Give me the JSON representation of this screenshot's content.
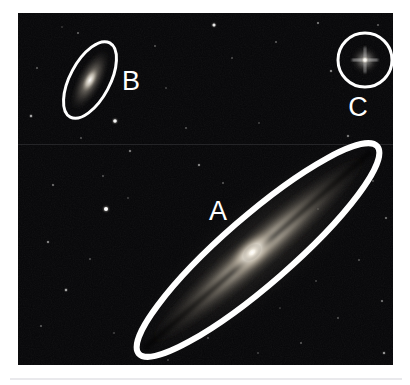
{
  "figure": {
    "kind": "astronomical-plate",
    "background_color": "#ffffff",
    "plate_color": "#050507",
    "annotation_color": "#ffffff",
    "plate_rect": {
      "x": 18,
      "y": 13,
      "width": 375,
      "height": 352
    }
  },
  "annotations": [
    {
      "id": "A",
      "label": "A",
      "shape": "ellipse",
      "object_type": "edge-on-spiral-galaxy",
      "label_x": 200,
      "label_y": 200,
      "cx": 240,
      "cy": 237,
      "rx": 158,
      "ry": 34,
      "rotation_deg": -41,
      "stroke_width": 6
    },
    {
      "id": "B",
      "label": "B",
      "shape": "ellipse",
      "object_type": "small-elongated-galaxy",
      "label_x": 113,
      "label_y": 70,
      "cx": 72,
      "cy": 67,
      "rx": 42,
      "ry": 20,
      "rotation_deg": -62,
      "stroke_width": 3
    },
    {
      "id": "C",
      "label": "C",
      "shape": "circle",
      "object_type": "foreground-star",
      "label_x": 340,
      "label_y": 96,
      "cx": 347,
      "cy": 47,
      "r": 27,
      "stroke_width": 3
    }
  ],
  "objects": {
    "galaxy_a": {
      "name": "galaxy-a",
      "cx": 240,
      "cy": 237,
      "length": 300,
      "thickness": 46,
      "rotation_deg": -41,
      "nucleus_brightness": "high",
      "has_dust_lane": true
    },
    "galaxy_b": {
      "name": "galaxy-b",
      "cx": 72,
      "cy": 67,
      "length": 62,
      "thickness": 20,
      "rotation_deg": -62,
      "nucleus_brightness": "medium"
    },
    "star_c": {
      "name": "star-c",
      "cx": 347,
      "cy": 47,
      "core_radius": 4,
      "has_diffraction_spikes": true
    }
  },
  "field_stars": [
    {
      "x": 60,
      "y": 20,
      "r": 0.8,
      "b": 0.45
    },
    {
      "x": 137,
      "y": 33,
      "r": 0.7,
      "b": 0.4
    },
    {
      "x": 196,
      "y": 12,
      "r": 1.5,
      "b": 0.85
    },
    {
      "x": 214,
      "y": 45,
      "r": 0.7,
      "b": 0.35
    },
    {
      "x": 258,
      "y": 29,
      "r": 0.8,
      "b": 0.4
    },
    {
      "x": 300,
      "y": 10,
      "r": 0.9,
      "b": 0.45
    },
    {
      "x": 313,
      "y": 58,
      "r": 1.0,
      "b": 0.5
    },
    {
      "x": 360,
      "y": 12,
      "r": 0.8,
      "b": 0.4
    },
    {
      "x": 19,
      "y": 55,
      "r": 0.8,
      "b": 0.4
    },
    {
      "x": 13,
      "y": 103,
      "r": 1.2,
      "b": 0.55
    },
    {
      "x": 97,
      "y": 108,
      "r": 1.8,
      "b": 0.95
    },
    {
      "x": 112,
      "y": 138,
      "r": 1.0,
      "b": 0.45
    },
    {
      "x": 63,
      "y": 125,
      "r": 0.8,
      "b": 0.35
    },
    {
      "x": 85,
      "y": 163,
      "r": 0.8,
      "b": 0.35
    },
    {
      "x": 88,
      "y": 196,
      "r": 2.0,
      "b": 1.0
    },
    {
      "x": 110,
      "y": 185,
      "r": 0.7,
      "b": 0.3
    },
    {
      "x": 35,
      "y": 172,
      "r": 0.9,
      "b": 0.4
    },
    {
      "x": 30,
      "y": 229,
      "r": 1.0,
      "b": 0.5
    },
    {
      "x": 72,
      "y": 246,
      "r": 0.8,
      "b": 0.35
    },
    {
      "x": 48,
      "y": 277,
      "r": 1.2,
      "b": 0.55
    },
    {
      "x": 23,
      "y": 313,
      "r": 0.8,
      "b": 0.4
    },
    {
      "x": 96,
      "y": 320,
      "r": 0.7,
      "b": 0.3
    },
    {
      "x": 148,
      "y": 75,
      "r": 0.7,
      "b": 0.3
    },
    {
      "x": 168,
      "y": 115,
      "r": 0.8,
      "b": 0.35
    },
    {
      "x": 181,
      "y": 152,
      "r": 1.0,
      "b": 0.5
    },
    {
      "x": 205,
      "y": 170,
      "r": 0.8,
      "b": 0.38
    },
    {
      "x": 241,
      "y": 110,
      "r": 0.7,
      "b": 0.3
    },
    {
      "x": 330,
      "y": 123,
      "r": 1.0,
      "b": 0.45
    },
    {
      "x": 355,
      "y": 168,
      "r": 0.8,
      "b": 0.35
    },
    {
      "x": 368,
      "y": 205,
      "r": 0.9,
      "b": 0.4
    },
    {
      "x": 341,
      "y": 247,
      "r": 0.8,
      "b": 0.35
    },
    {
      "x": 364,
      "y": 288,
      "r": 0.9,
      "b": 0.42
    },
    {
      "x": 320,
      "y": 305,
      "r": 0.8,
      "b": 0.35
    },
    {
      "x": 283,
      "y": 330,
      "r": 0.8,
      "b": 0.38
    },
    {
      "x": 240,
      "y": 340,
      "r": 0.7,
      "b": 0.3
    },
    {
      "x": 190,
      "y": 325,
      "r": 0.8,
      "b": 0.35
    },
    {
      "x": 150,
      "y": 347,
      "r": 0.7,
      "b": 0.3
    },
    {
      "x": 366,
      "y": 340,
      "r": 1.1,
      "b": 0.55
    },
    {
      "x": 298,
      "y": 268,
      "r": 0.7,
      "b": 0.3
    },
    {
      "x": 262,
      "y": 295,
      "r": 0.6,
      "b": 0.28
    },
    {
      "x": 44,
      "y": 14,
      "r": 0.6,
      "b": 0.28
    },
    {
      "x": 300,
      "y": 196,
      "r": 0.7,
      "b": 0.3
    }
  ]
}
